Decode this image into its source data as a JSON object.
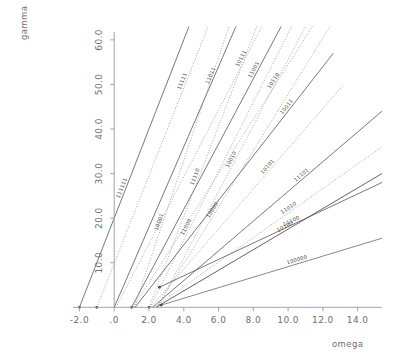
{
  "chart_data": {
    "type": "line",
    "title": "",
    "xlabel": "omega",
    "ylabel": "gamma",
    "xlim": [
      -2.6,
      15.4
    ],
    "ylim": [
      -1.5,
      64.0
    ],
    "grid": false,
    "legend": "inline-rotated-labels",
    "xticks": [
      -2.0,
      0.0,
      2.0,
      4.0,
      6.0,
      8.0,
      10.0,
      12.0,
      14.0
    ],
    "xticklabels": [
      "-2.0",
      ".0",
      "2.0",
      "4.0",
      "6.0",
      "8.0",
      "10.0",
      "12.0",
      "14.0"
    ],
    "yticks": [
      10.0,
      20.0,
      30.0,
      40.0,
      50.0,
      60.0
    ],
    "yticklabels": [
      "10.0",
      "20.0",
      "30.0",
      "40.0",
      "50.0",
      "60.0"
    ],
    "series": [
      {
        "name": "111111",
        "label": "111111",
        "style": "solid",
        "color": "#555555",
        "x0": -2.0,
        "y0": 0.0,
        "x1": 4.3,
        "y1": 63.0,
        "label_t": 0.42
      },
      {
        "name": "11111",
        "label": "11111",
        "style": "dotted",
        "color": "#8a8a8a",
        "x0": -1.0,
        "y0": 0.0,
        "x1": 5.4,
        "y1": 63.0,
        "label_t": 0.8
      },
      {
        "name": "11011",
        "label": "11011",
        "style": "solid",
        "color": "#555555",
        "x0": 0.0,
        "y0": 0.0,
        "x1": 7.0,
        "y1": 63.0,
        "label_t": 0.82
      },
      {
        "name": "10111",
        "label": "10111",
        "style": "dotted",
        "color": "#8a8a8a",
        "x0": 0.1,
        "y0": 0.0,
        "x1": 8.5,
        "y1": 63.0,
        "label_t": 0.88
      },
      {
        "name": "11001",
        "label": "11001",
        "style": "solid",
        "color": "#555555",
        "x0": 1.0,
        "y0": 0.0,
        "x1": 9.6,
        "y1": 63.0,
        "label_t": 0.84
      },
      {
        "name": "10110",
        "label": "10110",
        "style": "dotted",
        "color": "#8a8a8a",
        "x0": 1.1,
        "y0": 0.0,
        "x1": 11.4,
        "y1": 63.0,
        "label_t": 0.8
      },
      {
        "name": "10011",
        "label": "10011",
        "style": "solid",
        "color": "#555555",
        "x0": 1.2,
        "y0": 0.0,
        "x1": 12.6,
        "y1": 57.0,
        "label_t": 0.78
      },
      {
        "name": "11110",
        "label": "11110",
        "style": "dotted",
        "color": "#8a8a8a",
        "x0": 2.0,
        "y0": 0.0,
        "x1": 8.2,
        "y1": 63.0,
        "label_t": 0.46
      },
      {
        "name": "10101",
        "label": "10101",
        "style": "dotted",
        "color": "#8a8a8a",
        "x0": 2.1,
        "y0": 0.0,
        "x1": 13.2,
        "y1": 50.0,
        "label_t": 0.62
      },
      {
        "name": "11101",
        "label": "11101",
        "style": "solid",
        "color": "#555555",
        "x0": 2.2,
        "y0": 0.0,
        "x1": 15.4,
        "y1": 44.0,
        "label_t": 0.66
      },
      {
        "name": "11010",
        "label": "11010",
        "style": "dotted",
        "color": "#8a8a8a",
        "x0": 2.3,
        "y0": 0.0,
        "x1": 15.4,
        "y1": 36.0,
        "label_t": 0.6
      },
      {
        "name": "10100",
        "label": "10100",
        "style": "solid",
        "color": "#3a3a3a",
        "x0": 2.4,
        "y0": 0.0,
        "x1": 15.4,
        "y1": 30.0,
        "label_t": 0.58
      },
      {
        "name": "11100",
        "label": "11100",
        "style": "solid",
        "color": "#555555",
        "x0": 2.6,
        "y0": 4.5,
        "x1": 15.4,
        "y1": 28.0,
        "label_t": 0.6
      },
      {
        "name": "10010",
        "label": "10010",
        "style": "dotted",
        "color": "#8a8a8a",
        "x0": 2.5,
        "y0": 0.0,
        "x1": 11.0,
        "y1": 63.0,
        "label_t": 0.52
      },
      {
        "name": "100000",
        "label": "100000",
        "style": "solid",
        "color": "#6a6a6a",
        "x0": 2.7,
        "y0": 0.5,
        "x1": 15.4,
        "y1": 15.5,
        "label_t": 0.62
      },
      {
        "name": "10001",
        "label": "10001",
        "style": "dotted",
        "color": "#8a8a8a",
        "x0": 1.15,
        "y0": 0.0,
        "x1": 6.6,
        "y1": 63.0,
        "label_t": 0.3
      },
      {
        "name": "11000",
        "label": "11000",
        "style": "dotted",
        "color": "#8a8a8a",
        "x0": 2.05,
        "y0": 0.0,
        "x1": 10.2,
        "y1": 63.0,
        "label_t": 0.28
      },
      {
        "name": "10000",
        "label": "10000",
        "style": "dotted",
        "color": "#8a8a8a",
        "x0": 2.45,
        "y0": 0.0,
        "x1": 12.4,
        "y1": 63.0,
        "label_t": 0.34
      }
    ],
    "origin_markers": [
      {
        "x": -2.0,
        "y": 0.0
      },
      {
        "x": -1.0,
        "y": 0.0
      },
      {
        "x": 1.0,
        "y": 0.0
      },
      {
        "x": 2.0,
        "y": 0.0
      },
      {
        "x": 2.6,
        "y": 4.5
      },
      {
        "x": 2.7,
        "y": 0.5
      }
    ]
  }
}
